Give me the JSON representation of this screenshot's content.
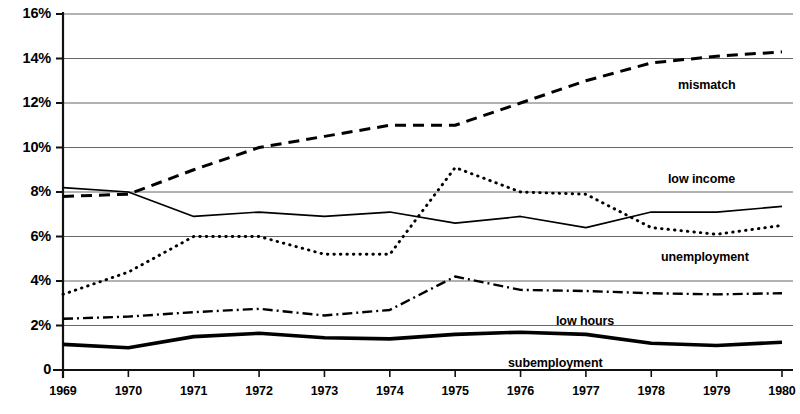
{
  "chart_data": {
    "type": "line",
    "title": "",
    "xlabel": "",
    "ylabel": "",
    "grid": true,
    "legend_position": "inline-annotations",
    "x": [
      1969,
      1970,
      1971,
      1972,
      1973,
      1974,
      1975,
      1976,
      1977,
      1978,
      1979,
      1980
    ],
    "categories": [
      "1969",
      "1970",
      "1971",
      "1972",
      "1973",
      "1974",
      "1975",
      "1976",
      "1977",
      "1978",
      "1979",
      "1980"
    ],
    "ylim": [
      0,
      16
    ],
    "ytick_values": [
      0,
      2,
      4,
      6,
      8,
      10,
      12,
      14,
      16
    ],
    "ytick_labels": [
      "0",
      "2%",
      "4%",
      "6%",
      "8%",
      "10%",
      "12%",
      "14%",
      "16%"
    ],
    "series": [
      {
        "name": "mismatch",
        "label": "mismatch",
        "style": "dashed",
        "color": "#000000",
        "values": [
          7.8,
          7.9,
          9.0,
          10.0,
          10.5,
          11.0,
          11.0,
          12.0,
          13.0,
          13.8,
          14.1,
          14.3
        ]
      },
      {
        "name": "low income",
        "label": "low income",
        "style": "dotted",
        "color": "#000000",
        "values": [
          3.4,
          4.4,
          6.0,
          6.0,
          5.2,
          5.2,
          9.1,
          8.0,
          7.9,
          6.4,
          6.1,
          6.5
        ]
      },
      {
        "name": "unemployment",
        "label": "unemployment",
        "style": "solid",
        "color": "#000000",
        "values": [
          8.2,
          8.0,
          6.9,
          7.1,
          6.9,
          7.1,
          6.6,
          6.9,
          6.4,
          7.1,
          7.1,
          7.35
        ]
      },
      {
        "name": "low hours",
        "label": "low hours",
        "style": "dash-dot",
        "color": "#000000",
        "values": [
          2.3,
          2.4,
          2.6,
          2.75,
          2.45,
          2.7,
          4.2,
          3.6,
          3.55,
          3.45,
          3.4,
          3.45
        ]
      },
      {
        "name": "subemployment",
        "label": "subemployment",
        "style": "solid-bold",
        "color": "#000000",
        "values": [
          1.15,
          1.0,
          1.5,
          1.65,
          1.45,
          1.4,
          1.6,
          1.7,
          1.6,
          1.2,
          1.1,
          1.25
        ]
      }
    ],
    "annotations": [
      {
        "text": "mismatch",
        "x_px": 678,
        "y_px": 78
      },
      {
        "text": "low income",
        "x_px": 668,
        "y_px": 172
      },
      {
        "text": "unemployment",
        "x_px": 661,
        "y_px": 250
      },
      {
        "text": "low hours",
        "x_px": 556,
        "y_px": 314
      },
      {
        "text": "subemployment",
        "x_px": 508,
        "y_px": 356
      }
    ]
  },
  "axes": {
    "y_labels": [
      "16%",
      "14%",
      "12%",
      "10%",
      "8%",
      "6%",
      "4%",
      "2%",
      "0"
    ],
    "x_labels": [
      "1969",
      "1970",
      "1971",
      "1972",
      "1973",
      "1974",
      "1975",
      "1976",
      "1977",
      "1978",
      "1979",
      "1980"
    ]
  }
}
